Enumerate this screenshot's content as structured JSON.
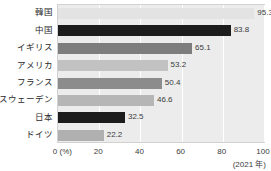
{
  "chart_data": {
    "type": "bar",
    "orientation": "horizontal",
    "title": "",
    "xlabel": "(%)",
    "ylabel": "",
    "xlim": [
      0,
      100
    ],
    "xticks": [
      "0 (%)",
      "20",
      "40",
      "60",
      "80",
      "100"
    ],
    "xtick_values": [
      0,
      20,
      40,
      60,
      80,
      100
    ],
    "grid": true,
    "legend": "none",
    "annotation": "(2021 年)",
    "categories": [
      "韓国",
      "中国",
      "イギリス",
      "アメリカ",
      "フランス",
      "スウェーデン",
      "日本",
      "ドイツ"
    ],
    "values": [
      95.3,
      83.8,
      65.1,
      53.2,
      50.4,
      46.6,
      32.5,
      22.2
    ],
    "value_labels": [
      "95.3",
      "83.8",
      "65.1",
      "53.2",
      "50.4",
      "46.6",
      "32.5",
      "22.2"
    ],
    "bar_colors": [
      "#e3e3e3",
      "#1c1c1c",
      "#7d7d7d",
      "#c2c2c2",
      "#8c8c8c",
      "#b6b6b6",
      "#1c1c1c",
      "#b0b0b0"
    ],
    "plot_background": "#ececec",
    "gridline_color": "#ffffff"
  }
}
